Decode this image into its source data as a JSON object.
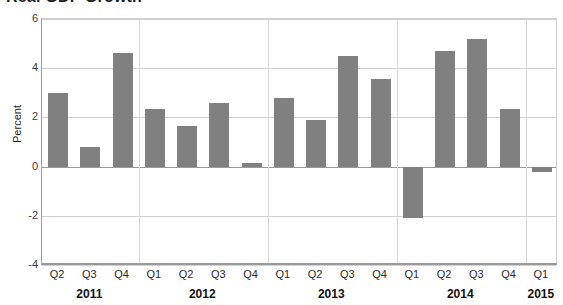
{
  "chart_data": {
    "type": "bar",
    "title": "Real GDP Growth",
    "xlabel": "",
    "ylabel": "Percent",
    "ylim": [
      -4,
      6
    ],
    "yticks": [
      6,
      4,
      2,
      0,
      -2,
      -4
    ],
    "grid": true,
    "legend": "none",
    "bar_color": "#808080",
    "categories": [
      "Q2",
      "Q3",
      "Q4",
      "Q1",
      "Q2",
      "Q3",
      "Q4",
      "Q1",
      "Q2",
      "Q3",
      "Q4",
      "Q1",
      "Q2",
      "Q3",
      "Q4",
      "Q1"
    ],
    "values": [
      3.0,
      0.8,
      4.6,
      2.35,
      1.65,
      2.6,
      0.15,
      2.8,
      1.9,
      4.5,
      3.55,
      -2.1,
      4.7,
      5.2,
      2.35,
      -0.2
    ],
    "year_groups": [
      {
        "year": "2011",
        "quarters": [
          "Q2",
          "Q3",
          "Q4"
        ]
      },
      {
        "year": "2012",
        "quarters": [
          "Q1",
          "Q2",
          "Q3",
          "Q4"
        ]
      },
      {
        "year": "2013",
        "quarters": [
          "Q1",
          "Q2",
          "Q3",
          "Q4"
        ]
      },
      {
        "year": "2014",
        "quarters": [
          "Q1",
          "Q2",
          "Q3",
          "Q4"
        ]
      },
      {
        "year": "2015",
        "quarters": [
          "Q1"
        ]
      }
    ]
  },
  "axis": {
    "y_tick_labels": [
      "6",
      "4",
      "2",
      "0",
      "-2",
      "-4"
    ],
    "y_axis_title": "Percent"
  },
  "header": {
    "title": "Real GDP Growth"
  }
}
